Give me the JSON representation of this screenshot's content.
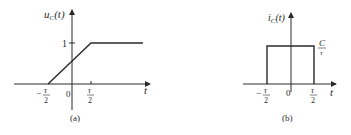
{
  "figure_a": {
    "caption": "(a)",
    "y_label_main": "u",
    "y_label_sub": "C",
    "y_label_arg": "(t)",
    "x_label": "t",
    "level_label": "1",
    "ticks": {
      "neg_half_minus": "−",
      "neg_half_num": "τ",
      "neg_half_den": "2",
      "zero": "0",
      "pos_half_num": "τ",
      "pos_half_den": "2"
    }
  },
  "figure_b": {
    "caption": "(b)",
    "y_label_main": "i",
    "y_label_sub": "C",
    "y_label_arg": "(t)",
    "x_label": "t",
    "level_num": "C",
    "level_den": "τ",
    "ticks": {
      "neg_half_minus": "−",
      "neg_half_num": "τ",
      "neg_half_den": "2",
      "zero": "0",
      "pos_half_num": "τ",
      "pos_half_den": "2"
    }
  },
  "colors": {
    "stroke": "#2a2a2a",
    "background": "#ffffff"
  }
}
